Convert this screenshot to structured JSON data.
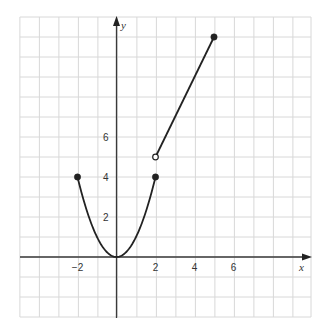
{
  "chart_data": {
    "type": "line",
    "title": "",
    "xlabel": "x",
    "ylabel": "y",
    "xlim": [
      -5,
      10
    ],
    "ylim": [
      -3,
      12
    ],
    "grid": true,
    "grid_step": 1,
    "x_tick_labels": [
      {
        "value": -2,
        "label": "−2"
      },
      {
        "value": 2,
        "label": "2"
      },
      {
        "value": 4,
        "label": "4"
      },
      {
        "value": 6,
        "label": "6"
      }
    ],
    "y_tick_labels": [
      {
        "value": 2,
        "label": "2"
      },
      {
        "value": 4,
        "label": "4"
      },
      {
        "value": 6,
        "label": "6"
      }
    ],
    "series": [
      {
        "name": "piece-1",
        "formula": "y = x^2",
        "domain": [
          -2,
          2
        ],
        "x": [
          -2,
          -1.5,
          -1,
          -0.5,
          0,
          0.5,
          1,
          1.5,
          2
        ],
        "y": [
          4,
          2.25,
          1,
          0.25,
          0,
          0.25,
          1,
          2.25,
          4
        ],
        "endpoints": [
          {
            "x": -2,
            "y": 4,
            "style": "closed"
          },
          {
            "x": 2,
            "y": 4,
            "style": "closed"
          }
        ]
      },
      {
        "name": "piece-2",
        "formula": "y = 2x + 1",
        "domain": [
          2,
          5
        ],
        "x": [
          2,
          5
        ],
        "y": [
          5,
          11
        ],
        "endpoints": [
          {
            "x": 2,
            "y": 5,
            "style": "open"
          },
          {
            "x": 5,
            "y": 11,
            "style": "closed"
          }
        ]
      }
    ],
    "colors": {
      "curve": "#222222",
      "axis": "#3a3a3a",
      "grid": "#d8d8d8",
      "background": "#ffffff"
    }
  },
  "labels": {
    "x_axis": "x",
    "y_axis": "y"
  }
}
